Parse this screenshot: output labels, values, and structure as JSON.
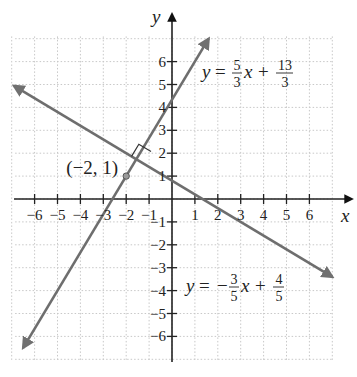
{
  "chart_data": {
    "type": "line",
    "title": "",
    "xlabel": "x",
    "ylabel": "y",
    "xlim": [
      -7,
      7
    ],
    "ylim": [
      -7,
      7
    ],
    "grid": true,
    "x_ticks": [
      -6,
      -5,
      -4,
      -3,
      -2,
      -1,
      1,
      2,
      3,
      4,
      5,
      6
    ],
    "y_ticks": [
      -6,
      -5,
      -4,
      -3,
      -2,
      -1,
      1,
      2,
      3,
      4,
      5,
      6
    ],
    "x_tick_labels": [
      "−6",
      "−5",
      "−4",
      "−3",
      "−2",
      "−1",
      "1",
      "2",
      "3",
      "4",
      "5",
      "6"
    ],
    "y_tick_labels": [
      "−6",
      "−5",
      "−4",
      "−3",
      "−2",
      "−1",
      "1",
      "2",
      "3",
      "4",
      "5",
      "6"
    ],
    "series": [
      {
        "name": "y = 5/3 x + 13/3",
        "slope": 1.6667,
        "intercept": 4.3333,
        "label": {
          "lhs": "y",
          "eq": "=",
          "num1": "5",
          "den1": "3",
          "var": "x",
          "op": "+",
          "num2": "13",
          "den2": "3"
        },
        "x": [
          -6.5,
          1.6
        ],
        "y": [
          -6.5,
          7.0
        ]
      },
      {
        "name": "y = -3/5 x + 4/5",
        "slope": -0.6,
        "intercept": 0.8,
        "label": {
          "lhs": "y",
          "eq": "=",
          "sign": "−",
          "num1": "3",
          "den1": "5",
          "var": "x",
          "op": "+",
          "num2": "4",
          "den2": "5"
        },
        "x": [
          -6.9,
          7.0
        ],
        "y": [
          4.94,
          -3.4
        ]
      }
    ],
    "annotations": [
      {
        "type": "point",
        "x": -2,
        "y": 1,
        "label": "(−2, 1)"
      },
      {
        "type": "right-angle-marker",
        "at": "intersection"
      }
    ]
  }
}
